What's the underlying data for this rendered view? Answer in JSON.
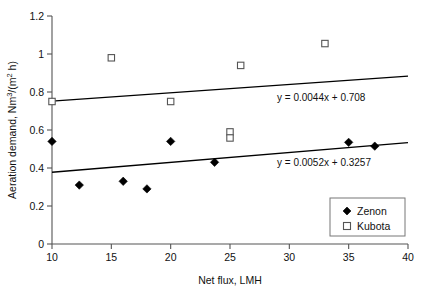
{
  "chart_data": {
    "type": "scatter",
    "title": "",
    "xlabel": "Net flux, LMH",
    "ylabel": "Aeration demand, Nm3/(m2 h)",
    "ylabel_parts": {
      "prefix": "Aeration demand, Nm",
      "sup1": "3",
      "mid": "/(m",
      "sup2": "2",
      "suffix": " h)"
    },
    "xlim": [
      10,
      40
    ],
    "ylim": [
      0,
      1.2
    ],
    "xticks": [
      10,
      15,
      20,
      25,
      30,
      35,
      40
    ],
    "xtick_labels": [
      "10",
      "15",
      "20",
      "25",
      "30",
      "35",
      "40"
    ],
    "yticks": [
      0,
      0.2,
      0.4,
      0.6,
      0.8,
      1,
      1.2
    ],
    "ytick_labels": [
      "0",
      "0.2",
      "0.4",
      "0.6",
      "0.8",
      "1",
      "1.2"
    ],
    "grid": false,
    "legend_position": "bottom-right",
    "series": [
      {
        "name": "Zenon",
        "marker": "filled-diamond",
        "color": "#000000",
        "points": [
          {
            "x": 10.0,
            "y": 0.54
          },
          {
            "x": 12.3,
            "y": 0.31
          },
          {
            "x": 16.0,
            "y": 0.33
          },
          {
            "x": 18.0,
            "y": 0.29
          },
          {
            "x": 20.0,
            "y": 0.54
          },
          {
            "x": 23.7,
            "y": 0.43
          },
          {
            "x": 35.0,
            "y": 0.535
          },
          {
            "x": 37.2,
            "y": 0.515
          }
        ],
        "trendline": {
          "slope": 0.0052,
          "intercept": 0.3257,
          "equation": "y = 0.0052x + 0.3257",
          "x_start": 10,
          "x_end": 40
        }
      },
      {
        "name": "Kubota",
        "marker": "open-square",
        "color": "#555555",
        "points": [
          {
            "x": 10.0,
            "y": 0.75
          },
          {
            "x": 15.0,
            "y": 0.98
          },
          {
            "x": 20.0,
            "y": 0.75
          },
          {
            "x": 25.0,
            "y": 0.59
          },
          {
            "x": 25.0,
            "y": 0.558
          },
          {
            "x": 25.9,
            "y": 0.94
          },
          {
            "x": 33.0,
            "y": 1.055
          }
        ],
        "trendline": {
          "slope": 0.0044,
          "intercept": 0.708,
          "equation": "y = 0.0044x + 0.708",
          "x_start": 10,
          "x_end": 40
        }
      }
    ],
    "annotations": [
      {
        "text": "y = 0.0044x + 0.708",
        "x_px": 277,
        "y_px": 101
      },
      {
        "text": "y = 0.0052x + 0.3257",
        "x_px": 277,
        "y_px": 166
      }
    ]
  },
  "legend": {
    "entries": [
      {
        "label": "Zenon",
        "marker": "filled-diamond"
      },
      {
        "label": "Kubota",
        "marker": "open-square"
      }
    ]
  }
}
